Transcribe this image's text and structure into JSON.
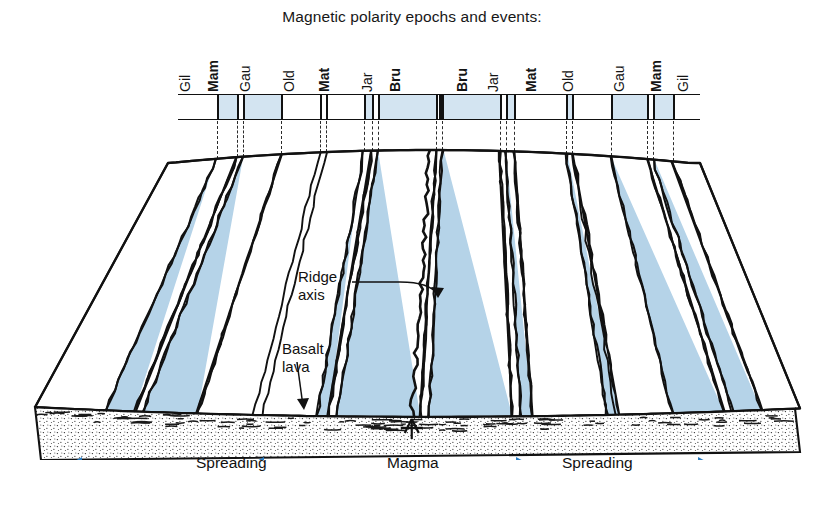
{
  "figure": {
    "title": "Magnetic polarity epochs and events:",
    "type": "seafloor-spreading-block-diagram"
  },
  "polarity_scale": {
    "labels": [
      {
        "text": "Gil",
        "x": 186,
        "bold": false
      },
      {
        "text": "Mam",
        "x": 214,
        "bold": true
      },
      {
        "text": "Gau",
        "x": 246,
        "bold": false
      },
      {
        "text": "Old",
        "x": 290,
        "bold": false
      },
      {
        "text": "Mat",
        "x": 325,
        "bold": true
      },
      {
        "text": "Jar",
        "x": 368,
        "bold": false
      },
      {
        "text": "Bru",
        "x": 396,
        "bold": true
      },
      {
        "text": "Bru",
        "x": 463,
        "bold": true
      },
      {
        "text": "Jar",
        "x": 494,
        "bold": false
      },
      {
        "text": "Mat",
        "x": 532,
        "bold": true
      },
      {
        "text": "Old",
        "x": 569,
        "bold": false
      },
      {
        "text": "Gau",
        "x": 620,
        "bold": false
      },
      {
        "text": "Mam",
        "x": 657,
        "bold": true
      },
      {
        "text": "Gil",
        "x": 684,
        "bold": false
      }
    ],
    "bar": {
      "left": 178,
      "top": 94,
      "width": 522,
      "height": 26,
      "fill_color": "#d3e4f1",
      "line_color": "#111111"
    },
    "segments": [
      {
        "left": 217,
        "width": 20
      },
      {
        "left": 243,
        "width": 38
      },
      {
        "left": 364,
        "width": 8
      },
      {
        "left": 378,
        "width": 58
      },
      {
        "left": 442,
        "width": 58
      },
      {
        "left": 506,
        "width": 8
      },
      {
        "left": 566,
        "width": 8
      },
      {
        "left": 611,
        "width": 36
      },
      {
        "left": 653,
        "width": 20
      }
    ],
    "dividers": [
      {
        "x": 217
      },
      {
        "x": 237
      },
      {
        "x": 243
      },
      {
        "x": 281
      },
      {
        "x": 320
      },
      {
        "x": 326
      },
      {
        "x": 364
      },
      {
        "x": 372
      },
      {
        "x": 378
      },
      {
        "x": 436
      },
      {
        "x": 442
      },
      {
        "x": 500
      },
      {
        "x": 506
      },
      {
        "x": 514
      },
      {
        "x": 566
      },
      {
        "x": 572
      },
      {
        "x": 611
      },
      {
        "x": 647
      },
      {
        "x": 653
      },
      {
        "x": 673
      }
    ],
    "ridge_divider_x": 439,
    "tie_lines": [
      217,
      237,
      243,
      281,
      320,
      326,
      364,
      372,
      378,
      436,
      442,
      500,
      506,
      514,
      566,
      572,
      611,
      647,
      653,
      673
    ]
  },
  "annotations": {
    "ridge_axis": {
      "line1": "Ridge",
      "line2": "axis",
      "x": 298,
      "y": 268
    },
    "basalt_lava": {
      "line1": "Basalt",
      "line2": "lava",
      "x": 282,
      "y": 340
    }
  },
  "bottom_labels": {
    "spreading_left": {
      "text": "Spreading",
      "x": 196,
      "y": 454
    },
    "magma": {
      "text": "Magma",
      "x": 387,
      "y": 454
    },
    "spreading_right": {
      "text": "Spreading",
      "x": 562,
      "y": 454
    }
  },
  "arrows": {
    "color": "#2b7dc2",
    "left": [
      {
        "x": 108,
        "y": 464,
        "dir": "left"
      },
      {
        "x": 290,
        "y": 464,
        "dir": "left"
      }
    ],
    "right": [
      {
        "x": 490,
        "y": 464,
        "dir": "right"
      },
      {
        "x": 672,
        "y": 464,
        "dir": "right"
      }
    ]
  },
  "colors": {
    "stripe_blue": "#b5d3e8",
    "bar_blue": "#d3e4f1",
    "arrow_blue": "#2b7dc2",
    "ink": "#111111",
    "sediment": "#ffffff"
  }
}
